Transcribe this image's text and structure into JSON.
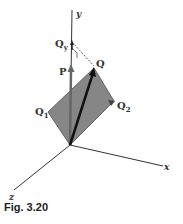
{
  "figure": {
    "caption": "Fig. 3.20",
    "axes": {
      "x": "x",
      "y": "y",
      "z": "z"
    },
    "vectors": {
      "Q": "Q",
      "Q1": "Q",
      "Q1_sub": "1",
      "Q2": "Q",
      "Q2_sub": "2",
      "Qy": "Q",
      "Qy_sub": "y",
      "P": "P"
    },
    "colors": {
      "plane": "#7a7a7a",
      "axis": "#333333",
      "vector": "#111111"
    }
  }
}
